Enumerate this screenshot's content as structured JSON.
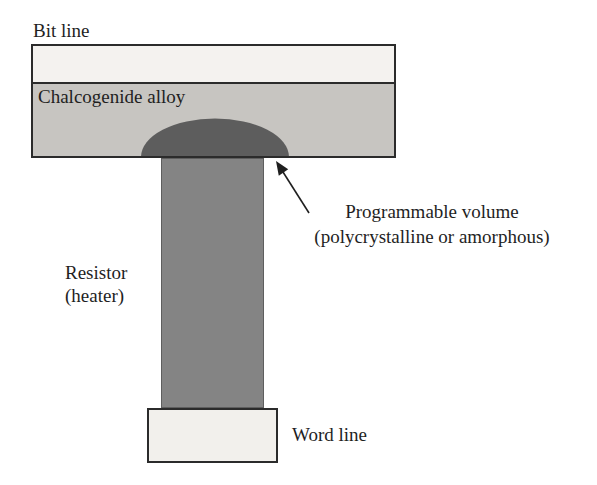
{
  "figure": {
    "labels": {
      "bit_line": "Bit line",
      "chalcogenide": "Chalcogenide alloy",
      "resistor_line1": "Resistor",
      "resistor_line2": "(heater)",
      "programmable_line1": "Programmable volume",
      "programmable_line2": "(polycrystalline or amorphous)",
      "word_line": "Word line"
    },
    "colors": {
      "background": "#ffffff",
      "bit_line_fill": "#f4f2ef",
      "chalcogenide_fill": "#c7c5c1",
      "programmable_volume_fill": "#5d5d5d",
      "resistor_fill": "#848484",
      "word_line_fill": "#f2f0ec",
      "outline": "#2b2b2b",
      "arrow": "#1f1f1f",
      "text": "#1f1f1f"
    }
  }
}
